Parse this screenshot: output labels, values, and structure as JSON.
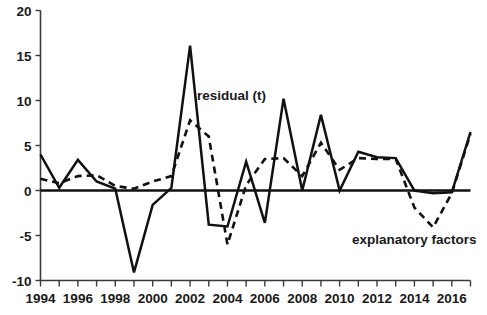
{
  "chart_data": {
    "type": "line",
    "title": "",
    "xlabel": "",
    "ylabel": "",
    "xlim": [
      1994,
      2017
    ],
    "ylim": [
      -10,
      20
    ],
    "yticks": [
      -10,
      -5,
      0,
      5,
      10,
      15,
      20
    ],
    "ytick_labels": [
      "-10",
      "-5",
      "0",
      "5",
      "10",
      "15",
      "20"
    ],
    "xticks": [
      1994,
      1995,
      1996,
      1997,
      1998,
      1999,
      2000,
      2001,
      2002,
      2003,
      2004,
      2005,
      2006,
      2007,
      2008,
      2009,
      2010,
      2011,
      2012,
      2013,
      2014,
      2015,
      2016,
      2017
    ],
    "xtick_labels": [
      "1994",
      "",
      "1996",
      "",
      "1998",
      "",
      "2000",
      "",
      "2002",
      "",
      "2004",
      "",
      "2006",
      "",
      "2008",
      "",
      "2010",
      "",
      "2012",
      "",
      "2014",
      "",
      "2016",
      ""
    ],
    "grid": false,
    "legend_position": "inline-annotations",
    "x": [
      1994,
      1995,
      1996,
      1997,
      1998,
      1999,
      2000,
      2001,
      2002,
      2003,
      2004,
      2005,
      2006,
      2007,
      2008,
      2009,
      2010,
      2011,
      2012,
      2013,
      2014,
      2015,
      2016,
      2017
    ],
    "series": [
      {
        "name": "residual (t)",
        "style": "solid",
        "values": [
          4.0,
          0.3,
          3.4,
          1.0,
          0.2,
          -9.1,
          -1.6,
          0.3,
          16.1,
          -3.8,
          -4.0,
          3.2,
          -3.6,
          10.2,
          0.0,
          8.4,
          0.0,
          4.3,
          3.7,
          3.6,
          0.0,
          -0.3,
          -0.2,
          6.5
        ]
      },
      {
        "name": "explanatory factors",
        "style": "dashed",
        "values": [
          1.3,
          0.8,
          1.6,
          1.7,
          0.5,
          0.2,
          1.0,
          1.6,
          7.8,
          6.0,
          -6.0,
          0.6,
          3.5,
          3.6,
          1.6,
          5.3,
          2.3,
          3.6,
          3.5,
          3.5,
          -1.9,
          -4.1,
          -0.3,
          6.3
        ]
      }
    ],
    "annotations": [
      {
        "name": "residual-label",
        "text": "residual (t)",
        "x_px": 197,
        "y_px": 100
      },
      {
        "name": "explanatory-factors-label",
        "text": "explanatory factors",
        "x_px": 352,
        "y_px": 244
      }
    ]
  },
  "axes": {
    "y_axis_name": "value-axis",
    "x_axis_name": "year-axis"
  }
}
